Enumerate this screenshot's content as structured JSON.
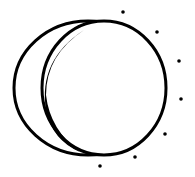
{
  "icon": {
    "name": "eclipse-moon-icon",
    "stroke_color": "#000000",
    "background": "#ffffff",
    "dots": [
      {
        "cx": 123,
        "cy": 12
      },
      {
        "cx": 157,
        "cy": 32
      },
      {
        "cx": 179,
        "cy": 61
      },
      {
        "cx": 181,
        "cy": 99
      },
      {
        "cx": 165,
        "cy": 134
      },
      {
        "cx": 135,
        "cy": 157
      },
      {
        "cx": 100,
        "cy": 166
      }
    ]
  }
}
